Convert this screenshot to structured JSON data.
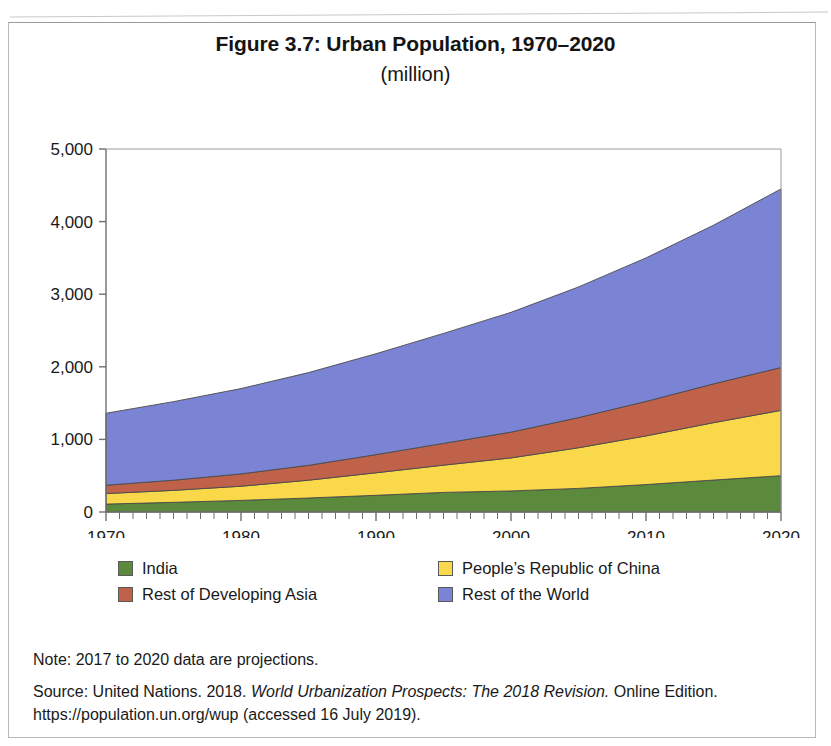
{
  "figure": {
    "title": "Figure 3.7: Urban Population, 1970–2020",
    "subtitle": "(million)"
  },
  "legend": {
    "items": [
      {
        "label": "India",
        "color": "#5C8A3C"
      },
      {
        "label": "People’s Republic of China",
        "color": "#F9D949"
      },
      {
        "label": "Rest of Developing Asia",
        "color": "#C0614A"
      },
      {
        "label": "Rest of the World",
        "color": "#7B84D4"
      }
    ]
  },
  "notes": {
    "note": "Note: 2017 to 2020 data are projections.",
    "source_prefix": "Source: United Nations. 2018. ",
    "source_italic": "World Urbanization Prospects: The 2018 Revision.",
    "source_suffix": " Online Edition.",
    "source_url_line": "https://population.un.org/wup (accessed 16 July 2019)."
  },
  "chart_data": {
    "type": "area",
    "stacked": true,
    "title": "Figure 3.7: Urban Population, 1970–2020",
    "subtitle": "(million)",
    "xlabel": "",
    "ylabel": "",
    "unit": "million",
    "xlim": [
      1970,
      2020
    ],
    "ylim": [
      0,
      5000
    ],
    "yticks": [
      0,
      1000,
      2000,
      3000,
      4000,
      5000
    ],
    "ytick_labels": [
      "0",
      "1,000",
      "2,000",
      "3,000",
      "4,000",
      "5,000"
    ],
    "xticks": [
      1970,
      1980,
      1990,
      2000,
      2010,
      2020
    ],
    "xtick_labels": [
      "1970",
      "1980",
      "1990",
      "2000",
      "2010",
      "2020"
    ],
    "x_minor_tick_interval": 1,
    "grid": false,
    "legend_position": "bottom",
    "x": [
      1970,
      1975,
      1980,
      1985,
      1990,
      1995,
      2000,
      2005,
      2010,
      2015,
      2020
    ],
    "series": [
      {
        "name": "India",
        "color": "#5C8A3C",
        "values": [
          109,
          133,
          160,
          193,
          230,
          270,
          290,
          325,
          378,
          440,
          500
        ]
      },
      {
        "name": "People’s Republic of China",
        "color": "#F9D949",
        "values": [
          145,
          165,
          195,
          245,
          310,
          375,
          455,
          560,
          670,
          790,
          900
        ]
      },
      {
        "name": "Rest of Developing Asia",
        "color": "#C0614A",
        "values": [
          115,
          140,
          170,
          205,
          250,
          300,
          355,
          415,
          475,
          535,
          590
        ]
      },
      {
        "name": "Rest of the World",
        "color": "#7B84D4",
        "values": [
          991,
          1082,
          1175,
          1277,
          1390,
          1515,
          1650,
          1800,
          1977,
          2185,
          2460
        ]
      }
    ],
    "totals": [
      1360,
      1520,
      1700,
      1920,
      2180,
      2460,
      2750,
      3100,
      3500,
      3950,
      4450
    ]
  }
}
